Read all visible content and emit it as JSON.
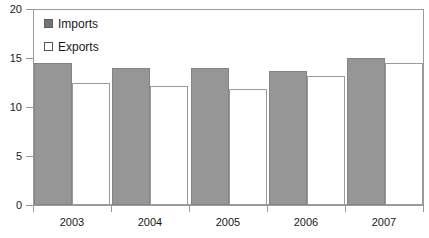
{
  "chart_data": {
    "type": "bar",
    "title": "",
    "subtitle": "",
    "xlabel": "",
    "ylabel": "",
    "categories": [
      "2003",
      "2004",
      "2005",
      "2006",
      "2007"
    ],
    "series": [
      {
        "name": "Imports",
        "values": [
          14.5,
          14.0,
          14.0,
          13.7,
          15.0
        ],
        "color": "#969696"
      },
      {
        "name": "Exports",
        "values": [
          12.4,
          12.1,
          11.8,
          13.2,
          14.5
        ],
        "color": "#ffffff"
      }
    ],
    "ylim": [
      0,
      20
    ],
    "yticks": [
      0,
      5,
      10,
      15,
      20
    ],
    "ytick_labels": [
      "0",
      "5",
      "10",
      "15",
      "20"
    ],
    "grid": false,
    "legend_position": "top-left",
    "annotations": []
  },
  "legend": {
    "items": [
      {
        "label": "Imports",
        "swatch": "filled-gray-square-icon"
      },
      {
        "label": "Exports",
        "swatch": "outlined-white-square-icon"
      }
    ]
  },
  "axes": {
    "y_tick_labels": [
      "20",
      "15",
      "10",
      "5",
      "0"
    ],
    "x_tick_labels": [
      "2003",
      "2004",
      "2005",
      "2006",
      "2007"
    ]
  }
}
